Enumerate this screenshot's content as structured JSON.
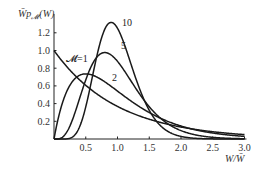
{
  "chart_data": {
    "type": "line",
    "title": "",
    "xlabel": "W/W̄",
    "ylabel": "W̄p𝓜(W)",
    "ylabel_parts": {
      "main": "W̄p",
      "sub": "𝓜",
      "tail": "(W)"
    },
    "xlim": [
      0,
      3.0
    ],
    "ylim": [
      0,
      1.3
    ],
    "x_ticks": [
      0.5,
      1.0,
      1.5,
      2.0,
      2.5,
      3.0
    ],
    "x_tick_labels": [
      "0.5",
      "1.0",
      "1.5",
      "2.0",
      "2.5",
      "3.0"
    ],
    "y_ticks": [
      0.2,
      0.4,
      0.6,
      0.8,
      1.0,
      1.2
    ],
    "y_tick_labels": [
      "0.2",
      "0.4",
      "0.6",
      "0.8",
      "1.0",
      "1.2"
    ],
    "grid": false,
    "legend": "inline curve labels",
    "series": [
      {
        "name": "𝓜=1",
        "label": "𝓜=1",
        "M": 1,
        "x": [
          0,
          0.1,
          0.2,
          0.3,
          0.4,
          0.5,
          0.6,
          0.7,
          0.8,
          0.9,
          1.0,
          1.2,
          1.4,
          1.6,
          1.8,
          2.0,
          2.5,
          3.0
        ],
        "values": [
          1.0,
          0.905,
          0.819,
          0.741,
          0.67,
          0.607,
          0.549,
          0.497,
          0.449,
          0.407,
          0.368,
          0.301,
          0.247,
          0.202,
          0.165,
          0.135,
          0.082,
          0.05
        ]
      },
      {
        "name": "2",
        "label": "2",
        "M": 2,
        "x": [
          0,
          0.1,
          0.2,
          0.3,
          0.4,
          0.5,
          0.6,
          0.7,
          0.8,
          0.9,
          1.0,
          1.2,
          1.4,
          1.6,
          1.8,
          2.0,
          2.5,
          3.0
        ],
        "values": [
          0,
          0.327,
          0.536,
          0.659,
          0.719,
          0.736,
          0.723,
          0.69,
          0.646,
          0.595,
          0.541,
          0.435,
          0.341,
          0.261,
          0.197,
          0.147,
          0.067,
          0.03
        ]
      },
      {
        "name": "5",
        "label": "5",
        "M": 5,
        "x": [
          0,
          0.1,
          0.2,
          0.3,
          0.4,
          0.5,
          0.6,
          0.7,
          0.8,
          0.9,
          1.0,
          1.2,
          1.4,
          1.6,
          1.8,
          2.0,
          2.5,
          3.0
        ],
        "values": [
          0,
          0.008,
          0.082,
          0.255,
          0.451,
          0.641,
          0.8,
          0.911,
          0.976,
          0.987,
          0.877,
          0.66,
          0.437,
          0.258,
          0.14,
          0.071,
          0.011,
          0.001
        ]
      },
      {
        "name": "10",
        "label": "10",
        "M": 10,
        "x": [
          0,
          0.2,
          0.3,
          0.4,
          0.5,
          0.6,
          0.7,
          0.8,
          0.9,
          1.0,
          1.1,
          1.2,
          1.3,
          1.4,
          1.6,
          1.8,
          2.0,
          2.5,
          3.0
        ],
        "values": [
          0,
          0.002,
          0.024,
          0.132,
          0.363,
          0.68,
          0.978,
          1.171,
          1.251,
          1.251,
          1.138,
          0.946,
          0.725,
          0.517,
          0.22,
          0.079,
          0.025,
          0.001,
          0
        ]
      }
    ]
  }
}
